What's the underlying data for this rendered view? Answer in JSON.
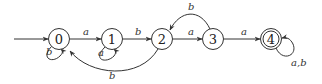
{
  "diagram": {
    "type": "finite-automaton",
    "colors": {
      "stroke": "#333333",
      "text": "#222222",
      "background": "#ffffff"
    },
    "start_state": "0",
    "states": [
      {
        "id": "0",
        "label": "0",
        "accepting": false
      },
      {
        "id": "1",
        "label": "1",
        "accepting": false
      },
      {
        "id": "2",
        "label": "2",
        "accepting": false
      },
      {
        "id": "3",
        "label": "3",
        "accepting": false
      },
      {
        "id": "4",
        "label": "4",
        "accepting": true
      }
    ],
    "transitions": [
      {
        "from": "0",
        "to": "0",
        "label": "b"
      },
      {
        "from": "0",
        "to": "1",
        "label": "a"
      },
      {
        "from": "1",
        "to": "1",
        "label": "a"
      },
      {
        "from": "1",
        "to": "2",
        "label": "b"
      },
      {
        "from": "2",
        "to": "0",
        "label": "b"
      },
      {
        "from": "2",
        "to": "3",
        "label": "a"
      },
      {
        "from": "3",
        "to": "2",
        "label": "b"
      },
      {
        "from": "3",
        "to": "4",
        "label": "a"
      },
      {
        "from": "4",
        "to": "4",
        "label": "a,b"
      }
    ]
  }
}
